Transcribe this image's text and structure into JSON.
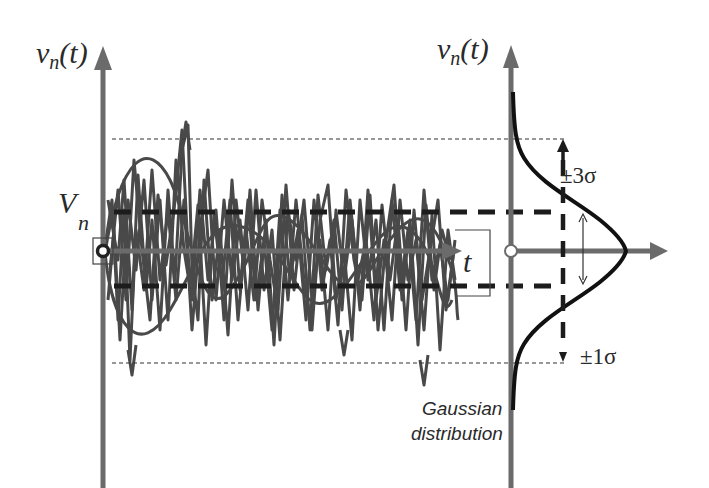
{
  "diagram": {
    "left_axis": {
      "label_main": "v",
      "label_sub": "n",
      "label_arg": "(t)"
    },
    "right_axis": {
      "label_main": "v",
      "label_sub": "n",
      "label_arg": "(t)"
    },
    "mean_label": {
      "main": "V",
      "sub": "n"
    },
    "time_label": "t",
    "sigma_top_label": "±3σ",
    "sigma_bottom_label": "±1σ",
    "distribution_label_line1": "Gaussian",
    "distribution_label_line2": "distribution",
    "colors": {
      "axis": "#6b6b6b",
      "noise": "#3a3a3a",
      "curve": "#111111",
      "dashes": "#1c1c1c",
      "text": "#2a2a2a"
    }
  }
}
